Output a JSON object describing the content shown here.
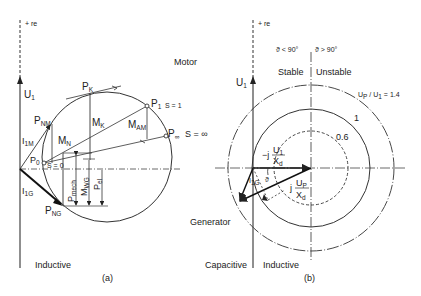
{
  "panel_a": {
    "caption": "(a)",
    "axis_label": "+ re",
    "voltage": {
      "main": "U",
      "sub": "1"
    },
    "mode_motor": "Motor",
    "mode_inductive": "Inductive",
    "points": {
      "pk": {
        "main": "P",
        "sub": "K"
      },
      "p1": {
        "main": "P",
        "sub": "1",
        "slip": "S = 1"
      },
      "pinf": {
        "main": "P",
        "sub": "∞",
        "slip": "S = ∞"
      },
      "pnm": {
        "main": "P",
        "sub": "NM"
      },
      "p0": {
        "main": "P",
        "sub": "0",
        "slip": "S = 0"
      },
      "png": {
        "main": "P",
        "sub": "NG"
      }
    },
    "quantities": {
      "mk": {
        "main": "M",
        "sub": "K"
      },
      "mam": {
        "main": "M",
        "sub": "AM"
      },
      "mn": {
        "main": "M",
        "sub": "N"
      },
      "i1m": {
        "main": "I",
        "sub": "1M"
      },
      "i1g": {
        "main": "I",
        "sub": "1G"
      },
      "pmech": {
        "main": "P",
        "sub": "mech"
      },
      "mwg": {
        "main": "M",
        "sub": "WG"
      },
      "pel": {
        "main": "P",
        "sub": "el"
      }
    }
  },
  "panel_b": {
    "caption": "(b)",
    "axis_label": "+ re",
    "voltage": {
      "main": "U",
      "sub": "1"
    },
    "angle_lt": "ϑ < 90°",
    "angle_gt": "ϑ > 90°",
    "stable": "Stable",
    "unstable": "Unstable",
    "ratio_label": "U",
    "ratio_sub": "P",
    "ratio_rest": " / U",
    "ratio_sub2": "1",
    "ratio_value": " = 1.4",
    "circle_1": "1",
    "circle_06": "0.6",
    "mode_generator": "Generator",
    "mode_capacitive": "Capacitive",
    "mode_inductive": "Inductive",
    "theta": "ϑ",
    "i1g": {
      "main": "I",
      "sub": "1G"
    },
    "frac1": {
      "prefix": "−j",
      "num": "U",
      "num_sub": "1",
      "den": "X",
      "den_sub": "d"
    },
    "frac2": {
      "prefix": "j",
      "num": "U",
      "num_sub": "P",
      "den": "X",
      "den_sub": "d"
    }
  }
}
